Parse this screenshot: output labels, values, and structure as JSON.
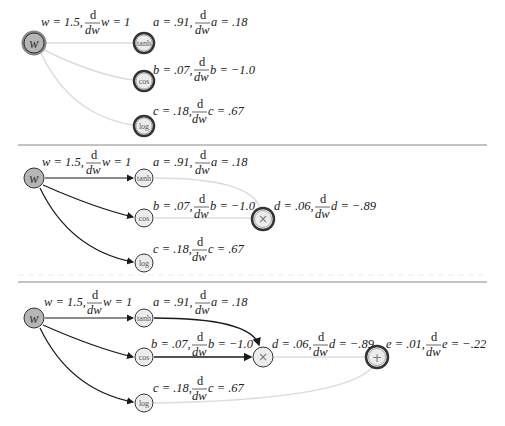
{
  "panels": [
    {
      "w_label": {
        "pre": "w = 1.5,",
        "frac_num": "d",
        "frac_den": "dw",
        "post": "w = 1"
      },
      "a_label": {
        "pre": "a = .91,",
        "frac_num": "d",
        "frac_den": "dw",
        "post": "a = .18"
      },
      "b_label": {
        "pre": "b = .07,",
        "frac_num": "d",
        "frac_den": "dw",
        "post": "b = −1.0"
      },
      "c_label": {
        "pre": "c = .18,",
        "frac_num": "d",
        "frac_den": "dw",
        "post": "c = .67"
      }
    },
    {
      "w_label": {
        "pre": "w = 1.5,",
        "frac_num": "d",
        "frac_den": "dw",
        "post": "w = 1"
      },
      "a_label": {
        "pre": "a = .91,",
        "frac_num": "d",
        "frac_den": "dw",
        "post": "a = .18"
      },
      "b_label": {
        "pre": "b = .07,",
        "frac_num": "d",
        "frac_den": "dw",
        "post": "b = −1.0"
      },
      "c_label": {
        "pre": "c = .18,",
        "frac_num": "d",
        "frac_den": "dw",
        "post": "c = .67"
      },
      "d_label": {
        "pre": "d = .06,",
        "frac_num": "d",
        "frac_den": "dw",
        "post": "d = −.89"
      }
    },
    {
      "w_label": {
        "pre": "w = 1.5,",
        "frac_num": "d",
        "frac_den": "dw",
        "post": "w = 1"
      },
      "a_label": {
        "pre": "a = .91,",
        "frac_num": "d",
        "frac_den": "dw",
        "post": "a = .18"
      },
      "b_label": {
        "pre": "b = .07,",
        "frac_num": "d",
        "frac_den": "dw",
        "post": "b = −1.0"
      },
      "c_label": {
        "pre": "c = .18,",
        "frac_num": "d",
        "frac_den": "dw",
        "post": "c = .67"
      },
      "d_label": {
        "pre": "d = .06,",
        "frac_num": "d",
        "frac_den": "dw",
        "post": "d = −.89"
      },
      "e_label": {
        "pre": "e = .01,",
        "frac_num": "d",
        "frac_den": "dw",
        "post": "e = −.22"
      }
    }
  ],
  "nodes": {
    "w": "w",
    "tanh": "tanh",
    "cos": "cos",
    "log": "log",
    "mul": "×",
    "add": "+"
  },
  "colors": {
    "w_fill": "#b5b5b5",
    "node_fill": "#ececec",
    "active_edge": "#1a1a1a",
    "faded_edge": "#dcdcdc",
    "divider": "#888888"
  }
}
